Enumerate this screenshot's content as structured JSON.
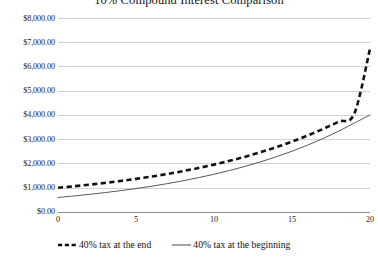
{
  "chart_data": {
    "type": "line",
    "title": "10% Compound Interest Comparison",
    "xlabel": "",
    "ylabel": "",
    "xlim": [
      0,
      20
    ],
    "ylim": [
      0,
      8000
    ],
    "grid": "horizontal",
    "legend_position": "bottom",
    "x_tick_labels": [
      "0",
      "5",
      "10",
      "15",
      "20"
    ],
    "x_tick_values": [
      0,
      5,
      10,
      15,
      20
    ],
    "y_tick_labels": [
      "$8,000.00",
      "$7,000.00",
      "$6,000.00",
      "$5,000.00",
      "$4,000.00",
      "$3,000.00",
      "$2,000.00",
      "$1,000.00",
      "$0.00"
    ],
    "y_tick_values": [
      8000,
      7000,
      6000,
      5000,
      4000,
      3000,
      2000,
      1000,
      0
    ],
    "x": [
      0,
      1,
      2,
      3,
      4,
      5,
      6,
      7,
      8,
      9,
      10,
      11,
      12,
      13,
      14,
      15,
      16,
      17,
      18,
      19,
      20
    ],
    "series": [
      {
        "name": "40% tax at the end",
        "style": "dashed",
        "color": "#111111",
        "values": [
          1000,
          1060,
          1126,
          1199,
          1279,
          1366,
          1462,
          1568,
          1684,
          1813,
          1954,
          2109,
          2280,
          2468,
          2675,
          2902,
          3152,
          3428,
          3730,
          4064,
          6730
        ],
        "start_value": 1000,
        "end_value": 6730
      },
      {
        "name": "40% tax at the beginning",
        "style": "solid",
        "color": "#595959",
        "values": [
          600,
          660,
          726,
          799,
          879,
          966,
          1063,
          1169,
          1286,
          1415,
          1556,
          1712,
          1883,
          2071,
          2278,
          2506,
          2757,
          3032,
          3335,
          3669,
          4000
        ],
        "start_value": 600,
        "end_value": 4000
      }
    ]
  },
  "legend": {
    "entries": [
      {
        "label": "40% tax at the end",
        "marker": "dashed-line-swatch"
      },
      {
        "label": "40% tax at the beginning",
        "marker": "solid-line-swatch"
      }
    ]
  },
  "colors": {
    "dashed_series": "#111111",
    "solid_series": "#595959",
    "gridline": "#d2d2d2",
    "axis_line": "#8d8d8d",
    "text": "#1b1b1b",
    "background": "#ffffff"
  }
}
